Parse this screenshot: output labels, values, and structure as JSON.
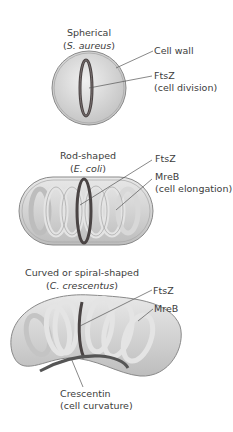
{
  "panels": [
    {
      "title": "Spherical",
      "species_open": "(",
      "species": "S. aureus",
      "species_close": ")",
      "labels": [
        {
          "text": "Cell wall"
        },
        {
          "text": "FtsZ",
          "subtext": "(cell division)"
        }
      ]
    },
    {
      "title": "Rod-shaped",
      "species_open": "(",
      "species": "E. coli",
      "species_close": ")",
      "labels": [
        {
          "text": "FtsZ"
        },
        {
          "text": "MreB",
          "subtext": "(cell elongation)"
        }
      ]
    },
    {
      "title": "Curved or spiral-shaped",
      "species_open": "(",
      "species": "C. crescentus",
      "species_close": ")",
      "labels": [
        {
          "text": "FtsZ"
        },
        {
          "text": "MreB"
        },
        {
          "text": "Crescentin",
          "subtext": "(cell curvature)"
        }
      ]
    }
  ],
  "colors": {
    "cell_fill": "#d4d4d4",
    "cell_outline": "#8a8a8a",
    "ftsz": "#4a4444",
    "mreb": "#e4e4e4",
    "crescentin": "#555555",
    "leader_line": "#555555"
  }
}
